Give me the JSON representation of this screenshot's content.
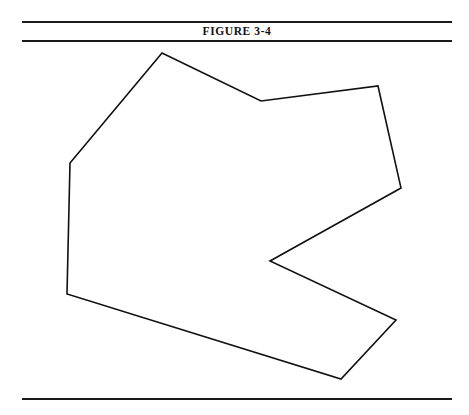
{
  "page": {
    "width": 469,
    "height": 415,
    "background_color": "#ffffff"
  },
  "caption": {
    "text": "FIGURE 3-4",
    "rule_color": "#1a1a1a"
  },
  "figure": {
    "shape_name": "irregular-concave-polygon",
    "stroke_color": "#111111",
    "stroke_width": 1.6,
    "fill": "none",
    "vertex_count": 9,
    "vertices": [
      {
        "x": 162,
        "y": 9
      },
      {
        "x": 261,
        "y": 57
      },
      {
        "x": 378,
        "y": 42
      },
      {
        "x": 401,
        "y": 144
      },
      {
        "x": 270,
        "y": 217
      },
      {
        "x": 396,
        "y": 276
      },
      {
        "x": 341,
        "y": 335
      },
      {
        "x": 67,
        "y": 250
      },
      {
        "x": 70,
        "y": 119
      }
    ],
    "points_attr": "162,9 261,57 378,42 401,144 270,217 396,276 341,335 67,250 70,119"
  }
}
